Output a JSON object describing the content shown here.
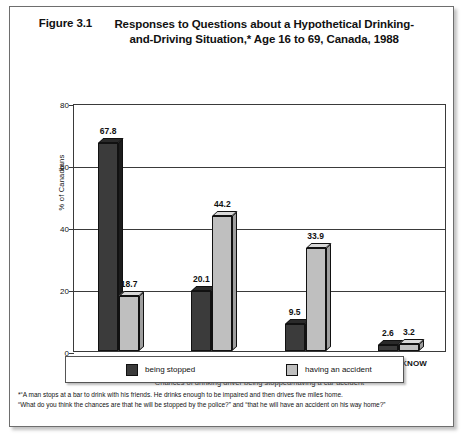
{
  "figure": {
    "number": "Figure 3.1",
    "title": "Responses to Questions about a Hypothetical Drinking-and-Driving Situation,* Age 16 to 69, Canada, 1988"
  },
  "legend": {
    "series_1_label": "being stopped",
    "series_2_label": "having an accident"
  },
  "footnote": {
    "line1": "*“A man stops at a bar to drink with his friends. He drinks enough to be impaired and then drives five miles home.",
    "line2": "“What do you think the chances are that he will be stopped by the police?” and “that he will have an accident on his way home?”"
  },
  "colors": {
    "series_1": "#3b3b3b",
    "series_1_top": "#2a2a2a",
    "series_1_side": "#1c1c1c",
    "series_2": "#bfbfbf",
    "series_2_top": "#d8d8d8",
    "series_2_side": "#9e9e9e",
    "axis": "#3a3a3a",
    "text": "#111111"
  },
  "chart_data": {
    "type": "bar",
    "title": "Responses to Questions about a Hypothetical Drinking-and-Driving Situation,* Age 16 to 69, Canada, 1988",
    "xlabel": "Chances of drinking driver being stopped/having a car accident",
    "ylabel": "% of Canadians",
    "categories": [
      "LOW",
      "MEDIUM",
      "HIGH",
      "DON'T KNOW"
    ],
    "series": [
      {
        "name": "being stopped",
        "values": [
          67.8,
          20.1,
          9.5,
          2.6
        ]
      },
      {
        "name": "having an accident",
        "values": [
          18.7,
          44.2,
          33.9,
          3.2
        ]
      }
    ],
    "ylim": [
      0,
      80
    ],
    "yticks": [
      0,
      20,
      40,
      60,
      80
    ],
    "ytick_labels": [
      "0",
      "20",
      "40",
      "60",
      "80"
    ],
    "grid": true,
    "legend_position": "bottom"
  }
}
